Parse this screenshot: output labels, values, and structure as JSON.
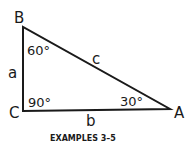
{
  "figure": {
    "vertices": {
      "A": "A",
      "B": "B",
      "C": "C"
    },
    "sides": {
      "a": "a",
      "b": "b",
      "c": "c"
    },
    "angles": {
      "B": "60°",
      "C": "90°",
      "A": "30°"
    },
    "caption": "EXAMPLES 3–5"
  }
}
